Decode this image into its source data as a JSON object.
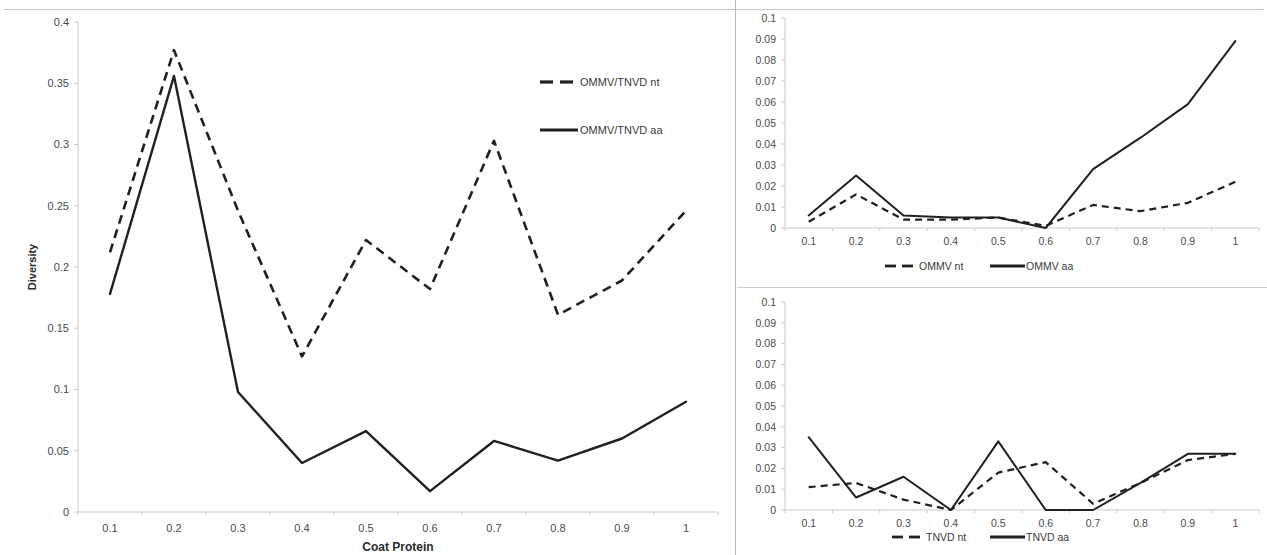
{
  "figure": {
    "background_color": "#ffffff",
    "line_color": "#231f20",
    "axis_color": "#c9c9c9"
  },
  "chart_data": [
    {
      "id": "main",
      "type": "line",
      "title": "",
      "xlabel": "Coat Protein",
      "ylabel": "Diversity",
      "x": [
        0.1,
        0.2,
        0.3,
        0.4,
        0.5,
        0.6,
        0.7,
        0.8,
        0.9,
        1
      ],
      "xtick_labels": [
        "0.1",
        "0.2",
        "0.3",
        "0.4",
        "0.5",
        "0.6",
        "0.7",
        "0.8",
        "0.9",
        "1"
      ],
      "ytick_labels": [
        "0",
        "0.05",
        "0.1",
        "0.15",
        "0.2",
        "0.25",
        "0.3",
        "0.35",
        "0.4"
      ],
      "ylim": [
        0,
        0.4
      ],
      "ytick_step": 0.05,
      "grid": false,
      "legend_position": "upper-right-inside",
      "series": [
        {
          "name": "OMMV/TNVD nt",
          "style": "dashed",
          "values": [
            0.212,
            0.377,
            0.246,
            0.127,
            0.222,
            0.182,
            0.303,
            0.161,
            0.189,
            0.246
          ]
        },
        {
          "name": "OMMV/TNVD aa",
          "style": "solid",
          "values": [
            0.178,
            0.356,
            0.098,
            0.04,
            0.066,
            0.017,
            0.058,
            0.042,
            0.06,
            0.09
          ]
        }
      ]
    },
    {
      "id": "ommv",
      "type": "line",
      "title": "",
      "xlabel": "",
      "ylabel": "",
      "x": [
        0.1,
        0.2,
        0.3,
        0.4,
        0.5,
        0.6,
        0.7,
        0.8,
        0.9,
        1
      ],
      "xtick_labels": [
        "0.1",
        "0.2",
        "0.3",
        "0.4",
        "0.5",
        "0.6",
        "0.7",
        "0.8",
        "0.9",
        "1"
      ],
      "ytick_labels": [
        "0",
        "0.01",
        "0.02",
        "0.03",
        "0.04",
        "0.05",
        "0.06",
        "0.07",
        "0.08",
        "0.09",
        "0.1"
      ],
      "ylim": [
        0,
        0.1
      ],
      "ytick_step": 0.01,
      "grid": false,
      "legend_position": "below",
      "series": [
        {
          "name": "OMMV nt",
          "style": "dashed",
          "values": [
            0.003,
            0.016,
            0.004,
            0.004,
            0.005,
            0.001,
            0.011,
            0.008,
            0.012,
            0.022
          ]
        },
        {
          "name": "OMMV aa",
          "style": "solid",
          "values": [
            0.006,
            0.025,
            0.006,
            0.005,
            0.005,
            0.0,
            0.028,
            0.043,
            0.059,
            0.089
          ]
        }
      ]
    },
    {
      "id": "tnvd",
      "type": "line",
      "title": "",
      "xlabel": "",
      "ylabel": "",
      "x": [
        0.1,
        0.2,
        0.3,
        0.4,
        0.5,
        0.6,
        0.7,
        0.8,
        0.9,
        1
      ],
      "xtick_labels": [
        "0.1",
        "0.2",
        "0.3",
        "0.4",
        "0.5",
        "0.6",
        "0.7",
        "0.8",
        "0.9",
        "1"
      ],
      "ytick_labels": [
        "0",
        "0.01",
        "0.02",
        "0.03",
        "0.04",
        "0.05",
        "0.06",
        "0.07",
        "0.08",
        "0.09",
        "0.1"
      ],
      "ylim": [
        0,
        0.1
      ],
      "ytick_step": 0.01,
      "grid": false,
      "legend_position": "below",
      "series": [
        {
          "name": "TNVD nt",
          "style": "dashed",
          "values": [
            0.011,
            0.013,
            0.005,
            0.0,
            0.018,
            0.023,
            0.003,
            0.013,
            0.024,
            0.027
          ]
        },
        {
          "name": "TNVD aa",
          "style": "solid",
          "values": [
            0.035,
            0.006,
            0.016,
            0.0,
            0.033,
            0.0,
            0.0,
            0.013,
            0.027,
            0.027
          ]
        }
      ]
    }
  ]
}
